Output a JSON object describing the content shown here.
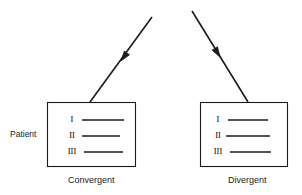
{
  "figure": {
    "side_label": "Patient",
    "line_color": "#1a1a1a",
    "text_color": "#1a1a1a",
    "background_color": "#ffffff",
    "panels": [
      {
        "id": "convergent",
        "caption": "Convergent",
        "box": {
          "x": 47,
          "y": 102,
          "width": 89,
          "height": 65
        },
        "rows": [
          {
            "numeral": "I",
            "line_x1": 82,
            "line_x2": 124,
            "line_y": 120
          },
          {
            "numeral": "II",
            "line_x1": 82,
            "line_x2": 120,
            "line_y": 136
          },
          {
            "numeral": "III",
            "line_x1": 84,
            "line_x2": 123,
            "line_y": 152
          }
        ],
        "arrow": {
          "name": "convergent-arrow",
          "x1": 152,
          "y1": 17,
          "x2": 90,
          "y2": 102,
          "head_x": 121,
          "head_y": 61,
          "direction": "down-left"
        }
      },
      {
        "id": "divergent",
        "caption": "Divergent",
        "box": {
          "x": 200,
          "y": 102,
          "width": 88,
          "height": 65
        },
        "rows": [
          {
            "numeral": "I",
            "line_x1": 228,
            "line_x2": 268,
            "line_y": 120
          },
          {
            "numeral": "II",
            "line_x1": 226,
            "line_x2": 270,
            "line_y": 136
          },
          {
            "numeral": "III",
            "line_x1": 230,
            "line_x2": 271,
            "line_y": 152
          }
        ],
        "arrow": {
          "name": "divergent-arrow",
          "x1": 192,
          "y1": 11,
          "x2": 248,
          "y2": 102,
          "head_x": 220,
          "head_y": 57,
          "direction": "down-right"
        }
      }
    ]
  }
}
